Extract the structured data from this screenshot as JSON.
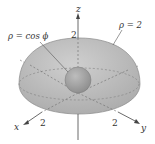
{
  "diagram": {
    "type": "3d-solid-region",
    "axes": {
      "x_label": "x",
      "y_label": "y",
      "z_label": "z",
      "x_tick": "2",
      "y_tick": "2",
      "z_tick": "2"
    },
    "surfaces": {
      "outer": {
        "label": "ρ = 2",
        "description": "upper hemisphere of radius 2"
      },
      "inner": {
        "label": "ρ = cos ϕ",
        "description": "small sphere"
      }
    },
    "colors": {
      "outer_fill": "#b9b9b9",
      "outer_edge": "#8a8a8a",
      "inner_fill": "#9e9e9e",
      "axis": "#555555",
      "dashed": "#6a6a6a"
    }
  }
}
